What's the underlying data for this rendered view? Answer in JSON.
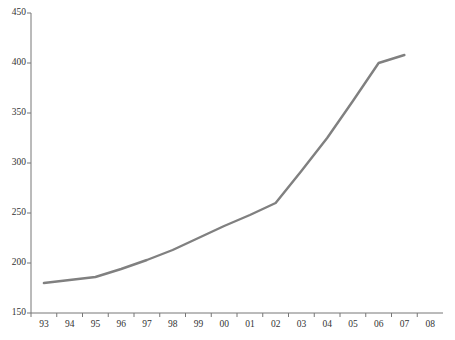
{
  "chart_data": {
    "type": "line",
    "title": "",
    "subtitle": "",
    "xlabel": "",
    "ylabel": "",
    "legend": [],
    "grid": false,
    "x": [
      "93",
      "94",
      "95",
      "96",
      "97",
      "98",
      "99",
      "00",
      "01",
      "02",
      "03",
      "04",
      "05",
      "06",
      "07"
    ],
    "categories": [
      "93",
      "94",
      "95",
      "96",
      "97",
      "98",
      "99",
      "00",
      "01",
      "02",
      "03",
      "04",
      "05",
      "06",
      "07"
    ],
    "series": [
      {
        "name": "series-1",
        "color": "#808080",
        "values": [
          180,
          183,
          186,
          194,
          203,
          213,
          225,
          237,
          248,
          260,
          292,
          325,
          362,
          400,
          408
        ]
      }
    ],
    "xlim": [
      "93",
      "08"
    ],
    "ylim": [
      150,
      450
    ],
    "xticks": [
      "93",
      "94",
      "95",
      "96",
      "97",
      "98",
      "99",
      "00",
      "01",
      "02",
      "03",
      "04",
      "05",
      "06",
      "07",
      "08"
    ],
    "yticks": [
      150,
      200,
      250,
      300,
      350,
      400,
      450
    ],
    "ytick_labels": [
      "150",
      "200",
      "250",
      "300",
      "350",
      "400",
      "450"
    ],
    "axis_color": "#777777",
    "line_color": "#808080",
    "line_width": 2.4,
    "background": "#ffffff"
  },
  "axes": {
    "y_labels": [
      "450",
      "400",
      "350",
      "300",
      "250",
      "200",
      "150"
    ],
    "x_labels": [
      "93",
      "94",
      "95",
      "96",
      "97",
      "98",
      "99",
      "00",
      "01",
      "02",
      "03",
      "04",
      "05",
      "06",
      "07",
      "08"
    ]
  }
}
